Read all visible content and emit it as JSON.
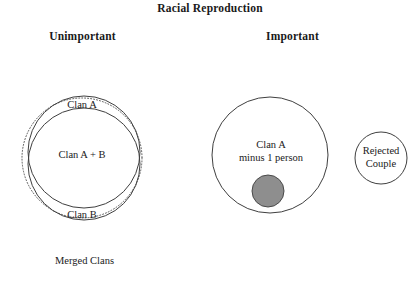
{
  "title": "Racial Reproduction",
  "columns": {
    "left_header": "Unimportant",
    "right_header": "Important"
  },
  "left_panel": {
    "outer_label": "Merged Clans",
    "circle_a_label": "Clan A",
    "circle_b_label": "Clan B",
    "overlap_label": "Clan A + B",
    "outer_boundary_style": "dotted"
  },
  "right_panel": {
    "main_circle_label_line1": "Clan A",
    "main_circle_label_line2": "minus 1 person",
    "small_circle_label_line1": "Rejected",
    "small_circle_label_line2": "Couple",
    "excluded_person_marker": "filled-gray-circle"
  },
  "colors": {
    "background": "#ffffff",
    "stroke": "#444444",
    "text": "#1a1a1a",
    "excluded_fill": "#8e8e8e",
    "excluded_stroke": "#4a4a4a"
  },
  "geometry": {
    "left_outer_dotted": {
      "cx": 82,
      "cy": 158,
      "r": 60
    },
    "left_circle_a": {
      "cx": 84,
      "cy": 152,
      "r": 56
    },
    "left_circle_b": {
      "cx": 84,
      "cy": 164,
      "r": 56
    },
    "right_main_circle": {
      "cx": 270,
      "cy": 155,
      "r": 58
    },
    "right_excluded_dot": {
      "cx": 268,
      "cy": 191,
      "r": 16
    },
    "right_small_circle": {
      "cx": 381,
      "cy": 158,
      "r": 26
    }
  }
}
